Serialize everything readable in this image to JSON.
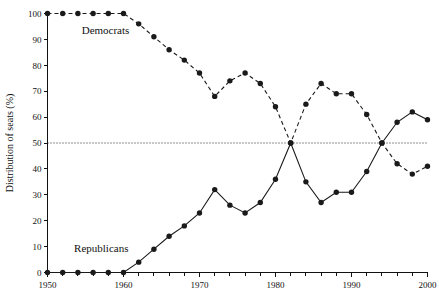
{
  "chart_data": {
    "type": "line",
    "title": "",
    "xlabel": "",
    "ylabel": "Distribution of seats (%)",
    "xlim": [
      1950,
      2000
    ],
    "ylim": [
      0,
      100
    ],
    "grid": false,
    "legend_position": "inline-annotations",
    "x_ticks": [
      1950,
      1960,
      1970,
      1980,
      1990,
      2000
    ],
    "x_tick_labels": [
      "1950",
      "1960",
      "1970",
      "1980",
      "1990",
      "2000"
    ],
    "x_minor_tick_step": 2,
    "y_ticks": [
      0,
      10,
      20,
      30,
      40,
      50,
      60,
      70,
      80,
      90,
      100
    ],
    "y_tick_labels": [
      "0",
      "10",
      "20",
      "30",
      "40",
      "50",
      "60",
      "70",
      "80",
      "90",
      "100"
    ],
    "reference_line": {
      "value": 50,
      "style": "dotted",
      "label": ""
    },
    "x": [
      1950,
      1952,
      1954,
      1956,
      1958,
      1960,
      1962,
      1964,
      1966,
      1968,
      1970,
      1972,
      1974,
      1976,
      1978,
      1980,
      1982,
      1984,
      1986,
      1988,
      1990,
      1992,
      1994,
      1996,
      1998,
      2000
    ],
    "series": [
      {
        "name": "Democrats",
        "line_style": "dashed",
        "marker": "circle",
        "values": [
          100,
          100,
          100,
          100,
          100,
          100,
          96,
          91,
          86,
          82,
          77,
          68,
          74,
          77,
          73,
          64,
          50,
          65,
          73,
          69,
          69,
          61,
          50,
          42,
          38,
          41
        ]
      },
      {
        "name": "Republicans",
        "line_style": "solid",
        "marker": "circle",
        "values": [
          0,
          0,
          0,
          0,
          0,
          0,
          4,
          9,
          14,
          18,
          23,
          32,
          26,
          23,
          27,
          36,
          50,
          35,
          27,
          31,
          31,
          39,
          50,
          58,
          62,
          59
        ]
      }
    ],
    "annotations": [
      {
        "text": "Democrats",
        "x": 1954.5,
        "y": 92
      },
      {
        "text": "Republicans",
        "x": 1953.5,
        "y": 8
      }
    ]
  },
  "colors": {
    "axis": "#111111",
    "democrats": "#1a1a1a",
    "republicans": "#1a1a1a",
    "reference_line": "#222222",
    "background": "#ffffff"
  }
}
